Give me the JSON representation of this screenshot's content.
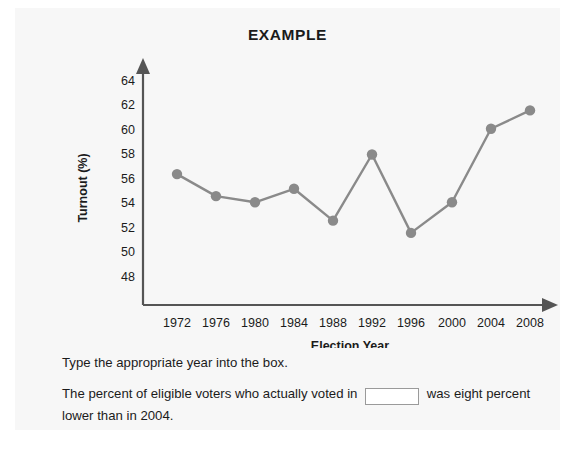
{
  "card": {
    "background": "#f7f7f7"
  },
  "chart_data": {
    "type": "line",
    "title": "EXAMPLE",
    "xlabel": "Election Year",
    "ylabel": "Turnout (%)",
    "categories": [
      "1972",
      "1976",
      "1980",
      "1984",
      "1988",
      "1992",
      "1996",
      "2000",
      "2004",
      "2008"
    ],
    "values": [
      56.4,
      54.6,
      54.1,
      55.2,
      52.6,
      58.0,
      51.6,
      54.1,
      60.1,
      61.6
    ],
    "ylim": [
      47,
      65
    ],
    "yticks": [
      "48",
      "50",
      "52",
      "54",
      "56",
      "58",
      "60",
      "62",
      "64"
    ],
    "ytick_values": [
      48,
      50,
      52,
      54,
      56,
      58,
      60,
      62,
      64
    ],
    "grid": false,
    "legend": "none",
    "series_color": "#8a8a8a",
    "axis_color": "#555555",
    "marker": "circle"
  },
  "question": {
    "prompt": "Type the appropriate year into the box.",
    "sentence_part1": "The percent of eligible voters who actually voted in",
    "sentence_part2": "was eight percent lower than in 2004.",
    "input_value": "",
    "input_placeholder": ""
  }
}
